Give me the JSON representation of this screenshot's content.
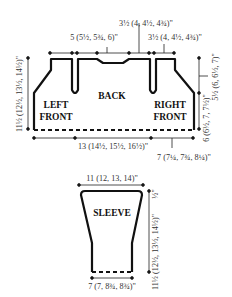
{
  "diagram": {
    "type": "knitting-schematic",
    "colors": {
      "outline": "#111111",
      "dim_line": "#222222",
      "text": "#333333"
    },
    "body": {
      "pieces": {
        "left_front": [
          "LEFT",
          "FRONT"
        ],
        "back": "BACK",
        "right_front": [
          "RIGHT",
          "FRONT"
        ]
      },
      "dimensions": {
        "top_neck": "3½ (4, 4½, 4¾)\"",
        "top_left_shoulder": "5 (5½, 5¾, 6)\"",
        "top_right_shoulder": "3½ (4, 4½, 4¾)\"",
        "left_height": "11½ (12½, 13½, 14½)\"",
        "right_armhole": "5½ (6, 6½, 7)\"",
        "right_lower": "6 (6½, 7, 7½)\"",
        "bottom_back": "13 (14½, 15½, 16½)\"",
        "bottom_front": "7 (7¼, 7¾, 8¼)\""
      }
    },
    "sleeve": {
      "piece": "SLEEVE",
      "dimensions": {
        "top_width": "11 (12, 13, 14)\"",
        "cap": "½\"",
        "length": "11½ (12½, 13½, 14½)\"",
        "cuff_width": "7 (7, 8¾, 8¾)\""
      }
    }
  }
}
